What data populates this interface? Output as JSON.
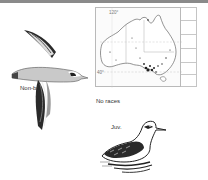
{
  "page": {
    "top_bar_color": "#8a8a8a"
  },
  "map": {
    "region": "Australia",
    "longitude_label": "120°",
    "latitude_label": "40°",
    "caption": "No races"
  },
  "illustrations": [
    {
      "id": "flying-bird",
      "label": "Non-br."
    },
    {
      "id": "swimming-bird",
      "label": "Juv."
    }
  ]
}
